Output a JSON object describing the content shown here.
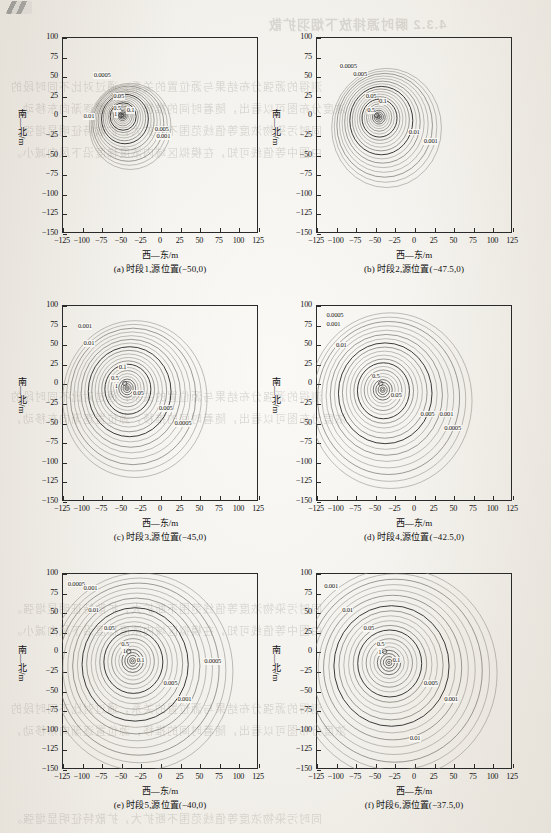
{
  "page": {
    "background_color": "#f3f1ec",
    "ink_color": "#1c1c1c",
    "ghost_text": [
      "4.3.2  瞬时源排放下烟羽扩散",
      "测得的源强分布结果与源位置的关系，通过对比不同时段的",
      "浓度分布图可以看出，随着时间的推移，源位置逐渐向东移动，",
      "同时污染物浓度等值线范围不断扩大，扩散特征明显增强。",
      "由图中等值线可知，在模拟区域内浓度梯度沿下风向减小。"
    ]
  },
  "chart_data": {
    "type": "contour",
    "panel_count": 6,
    "shared": {
      "xlabel": "西—东/m",
      "ylabel": "南—北/m",
      "xticks": [
        -125,
        -100,
        -75,
        -50,
        -25,
        0,
        25,
        50,
        75,
        100,
        125
      ],
      "yticks": [
        100,
        75,
        50,
        25,
        0,
        -25,
        -50,
        -75,
        -100,
        -125,
        -150
      ],
      "xlim": [
        -125,
        125
      ],
      "ylim": [
        -150,
        100
      ],
      "grid": false,
      "legend": "none",
      "contour_levels": [
        0.0005,
        0.001,
        0.005,
        0.01,
        0.05,
        0.1,
        0.5,
        1
      ]
    },
    "panels": [
      {
        "id": "a",
        "caption": "(a) 时段1,源位置(−50,0)",
        "time_period": 1,
        "source_position": [
          -50,
          0
        ],
        "plume_center": [
          -48,
          0
        ],
        "plume_radius_x": 52,
        "plume_radius_y": 55,
        "labeled_contours": [
          {
            "value": "0.0005",
            "x": -75,
            "y": 50
          },
          {
            "value": "0.001",
            "x": 5,
            "y": -28
          },
          {
            "value": "0.005",
            "x": 3,
            "y": -18
          },
          {
            "value": "0.01",
            "x": -88,
            "y": -2
          },
          {
            "value": "0.05",
            "x": -50,
            "y": 23
          },
          {
            "value": "0.1",
            "x": -33,
            "y": 5
          },
          {
            "value": "0.5",
            "x": -50,
            "y": 8
          },
          {
            "value": "1",
            "x": -49,
            "y": 0
          }
        ]
      },
      {
        "id": "b",
        "caption": "(b) 时段2,源位置(−47.5,0)",
        "time_period": 2,
        "source_position": [
          -47.5,
          0
        ],
        "plume_center": [
          -45,
          -2
        ],
        "plume_radius_x": 70,
        "plume_radius_y": 76,
        "labeled_contours": [
          {
            "value": "0.0005",
            "x": -85,
            "y": 62
          },
          {
            "value": "0.005",
            "x": -68,
            "y": 52
          },
          {
            "value": "0.05",
            "x": -52,
            "y": 24
          },
          {
            "value": "0.1",
            "x": -35,
            "y": 17
          },
          {
            "value": "0.5",
            "x": -50,
            "y": 5
          },
          {
            "value": "0.01",
            "x": 3,
            "y": -22
          },
          {
            "value": "0.001",
            "x": 22,
            "y": -34
          }
        ]
      },
      {
        "id": "c",
        "caption": "(c) 时段3,源位置(−45,0)",
        "time_period": 3,
        "source_position": [
          -45,
          0
        ],
        "plume_center": [
          -42,
          -6
        ],
        "plume_radius_x": 92,
        "plume_radius_y": 100,
        "labeled_contours": [
          {
            "value": "0.001",
            "x": -95,
            "y": 72
          },
          {
            "value": "0.01",
            "x": -88,
            "y": 50
          },
          {
            "value": "0.1",
            "x": -43,
            "y": 20
          },
          {
            "value": "0.5",
            "x": -53,
            "y": 5
          },
          {
            "value": "1",
            "x": -48,
            "y": -4
          },
          {
            "value": "0.05",
            "x": -25,
            "y": -13
          },
          {
            "value": "0.005",
            "x": 8,
            "y": -33
          },
          {
            "value": "0.0005",
            "x": 28,
            "y": -52
          }
        ]
      },
      {
        "id": "d",
        "caption": "(d) 时段4,源位置(−42.5,0)",
        "time_period": 4,
        "source_position": [
          -42.5,
          0
        ],
        "plume_center": [
          -40,
          -8
        ],
        "plume_radius_x": 104,
        "plume_radius_y": 112,
        "labeled_contours": [
          {
            "value": "0.0005",
            "x": -102,
            "y": 86
          },
          {
            "value": "0.001",
            "x": -102,
            "y": 74
          },
          {
            "value": "0.01",
            "x": -90,
            "y": 48
          },
          {
            "value": "0.5",
            "x": -44,
            "y": 8
          },
          {
            "value": "0.05",
            "x": -20,
            "y": -16
          },
          {
            "value": "0.005",
            "x": 18,
            "y": -40
          },
          {
            "value": "0.001",
            "x": 42,
            "y": -40
          },
          {
            "value": "0.0005",
            "x": 48,
            "y": -58
          }
        ]
      },
      {
        "id": "e",
        "caption": "(e) 时段5,源位置(−40,0)",
        "time_period": 5,
        "source_position": [
          -40,
          0
        ],
        "plume_center": [
          -35,
          -12
        ],
        "plume_radius_x": 118,
        "plume_radius_y": 126,
        "labeled_contours": [
          {
            "value": "0.0005",
            "x": -108,
            "y": 85
          },
          {
            "value": "0.001",
            "x": -88,
            "y": 80
          },
          {
            "value": "0.01",
            "x": -82,
            "y": 52
          },
          {
            "value": "0.05",
            "x": -62,
            "y": 28
          },
          {
            "value": "0.5",
            "x": -40,
            "y": 8
          },
          {
            "value": "1",
            "x": -38,
            "y": -1
          },
          {
            "value": "0.1",
            "x": -20,
            "y": -12
          },
          {
            "value": "0.005",
            "x": 14,
            "y": -42
          },
          {
            "value": "0.001",
            "x": 32,
            "y": -62
          },
          {
            "value": "0.0005",
            "x": 66,
            "y": -14
          }
        ]
      },
      {
        "id": "f",
        "caption": "(f) 时段6,源位置(−37.5,0)",
        "time_period": 6,
        "source_position": [
          -37.5,
          0
        ],
        "plume_center": [
          -32,
          -14
        ],
        "plume_radius_x": 128,
        "plume_radius_y": 134,
        "labeled_contours": [
          {
            "value": "0.001",
            "x": -105,
            "y": 82
          },
          {
            "value": "0.01",
            "x": -82,
            "y": 52
          },
          {
            "value": "0.05",
            "x": -55,
            "y": 28
          },
          {
            "value": "0.5",
            "x": -38,
            "y": 8
          },
          {
            "value": "1",
            "x": -36,
            "y": -2
          },
          {
            "value": "0.1",
            "x": -18,
            "y": -12
          },
          {
            "value": "0.005",
            "x": 22,
            "y": -42
          },
          {
            "value": "0.001",
            "x": 48,
            "y": -62
          },
          {
            "value": "0.01",
            "x": 4,
            "y": -112
          }
        ]
      }
    ]
  }
}
